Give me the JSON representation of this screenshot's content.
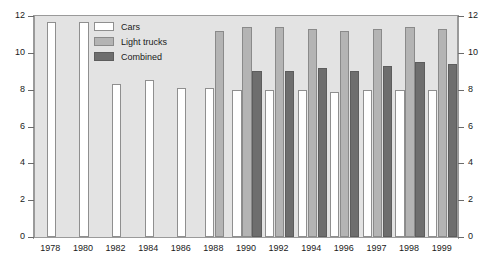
{
  "chart_data": {
    "type": "bar",
    "title": "",
    "subtitle": "",
    "xlabel": "",
    "ylabel": "",
    "ylim": [
      0,
      12
    ],
    "yticks": [
      0,
      2,
      4,
      6,
      8,
      10,
      12
    ],
    "ytick_labels": [
      "0",
      "2",
      "4",
      "6",
      "8",
      "10",
      "12"
    ],
    "y_axis_both_sides": true,
    "grid": false,
    "legend_position": "top-left-inside",
    "categories": [
      "1978",
      "1980",
      "1982",
      "1984",
      "1986",
      "1988",
      "1990",
      "1992",
      "1994",
      "1996",
      "1997",
      "1998",
      "1999"
    ],
    "series": [
      {
        "name": "Cars",
        "color": "#ffffff",
        "values": [
          11.7,
          11.7,
          8.3,
          8.5,
          8.1,
          8.1,
          8.0,
          8.0,
          8.0,
          7.9,
          8.0,
          8.0,
          8.0
        ]
      },
      {
        "name": "Light trucks",
        "color": "#b4b4b4",
        "values": [
          null,
          null,
          null,
          null,
          null,
          11.2,
          11.4,
          11.4,
          11.3,
          11.2,
          11.3,
          11.4,
          11.3
        ]
      },
      {
        "name": "Combined",
        "color": "#6e6e6e",
        "values": [
          null,
          null,
          null,
          null,
          null,
          null,
          9.0,
          9.0,
          9.2,
          9.0,
          9.3,
          9.5,
          9.4
        ]
      }
    ]
  },
  "legend": {
    "items": [
      {
        "label": "Cars",
        "swatch_class": "sw-cars"
      },
      {
        "label": "Light trucks",
        "swatch_class": "sw-light"
      },
      {
        "label": "Combined",
        "swatch_class": "sw-combined"
      }
    ]
  }
}
